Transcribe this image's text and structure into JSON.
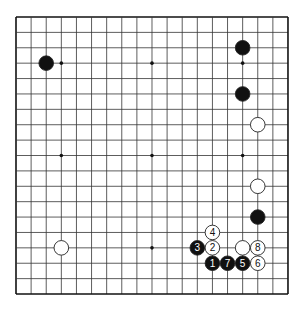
{
  "board": {
    "size": 19,
    "origin_x": 16,
    "origin_y": 17,
    "spacing_x": 15.11,
    "spacing_y": 15.39,
    "line_color": "#333333",
    "border_color": "#111111",
    "star_points": [
      [
        3,
        3
      ],
      [
        9,
        3
      ],
      [
        15,
        3
      ],
      [
        3,
        9
      ],
      [
        9,
        9
      ],
      [
        15,
        9
      ],
      [
        3,
        15
      ],
      [
        9,
        15
      ],
      [
        15,
        15
      ]
    ]
  },
  "stones": [
    {
      "color": "black",
      "col": 2,
      "row": 3,
      "label": ""
    },
    {
      "color": "black",
      "col": 15,
      "row": 2,
      "label": ""
    },
    {
      "color": "black",
      "col": 15,
      "row": 5,
      "label": ""
    },
    {
      "color": "white",
      "col": 16,
      "row": 7,
      "label": ""
    },
    {
      "color": "white",
      "col": 16,
      "row": 11,
      "label": ""
    },
    {
      "color": "black",
      "col": 16,
      "row": 13,
      "label": ""
    },
    {
      "color": "white",
      "col": 3,
      "row": 15,
      "label": ""
    },
    {
      "color": "white",
      "col": 13,
      "row": 14,
      "label": "4"
    },
    {
      "color": "white",
      "col": 13,
      "row": 15,
      "label": "2"
    },
    {
      "color": "black",
      "col": 12,
      "row": 15,
      "label": "3"
    },
    {
      "color": "white",
      "col": 15,
      "row": 15,
      "label": ""
    },
    {
      "color": "white",
      "col": 16,
      "row": 15,
      "label": "8"
    },
    {
      "color": "black",
      "col": 13,
      "row": 16,
      "label": "1"
    },
    {
      "color": "black",
      "col": 14,
      "row": 16,
      "label": "7"
    },
    {
      "color": "black",
      "col": 15,
      "row": 16,
      "label": "5"
    },
    {
      "color": "white",
      "col": 16,
      "row": 16,
      "label": "6"
    }
  ]
}
